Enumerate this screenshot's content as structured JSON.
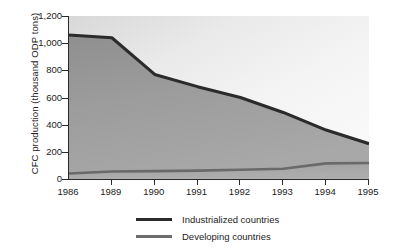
{
  "chart_data": {
    "type": "area",
    "title": "",
    "subtitle": "",
    "xlabel": "",
    "ylabel": "CFC production (thousand ODP tons)",
    "categories": [
      "1986",
      "1989",
      "1990",
      "1991",
      "1992",
      "1993",
      "1994",
      "1995"
    ],
    "series": [
      {
        "name": "Industrialized countries",
        "values": [
          1060,
          1040,
          770,
          680,
          600,
          490,
          360,
          260
        ],
        "color": "#2b2b2b"
      },
      {
        "name": "Developing countries",
        "values": [
          40,
          55,
          58,
          62,
          68,
          75,
          115,
          118
        ],
        "color": "#6d6d6d"
      }
    ],
    "ylim": [
      0,
      1200
    ],
    "ytick_labels": [
      "1,200",
      "1,000",
      "800",
      "600",
      "400",
      "200",
      "0"
    ],
    "ytick_values": [
      1200,
      1000,
      800,
      600,
      400,
      200,
      0
    ],
    "grid": false,
    "legend_position": "bottom"
  },
  "legend": {
    "items": [
      {
        "label": "Industrialized countries"
      },
      {
        "label": "Developing countries"
      }
    ]
  }
}
